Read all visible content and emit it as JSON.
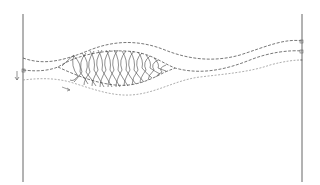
{
  "diagram": {
    "type": "line-drawing",
    "colors": {
      "background": "#ffffff",
      "post": "#666666",
      "dashed_line": "#555555",
      "light_dashed_line": "#999999",
      "mesh": "#444444"
    },
    "elements": {
      "left_post": {
        "x": 23,
        "y_top": 14,
        "y_bottom": 182
      },
      "right_post": {
        "x": 302,
        "y_top": 14,
        "y_bottom": 182
      },
      "arrows": [
        {
          "name": "down-arrow",
          "x": 17,
          "y": 76
        },
        {
          "name": "flow-arrow",
          "x": 67,
          "y": 89
        }
      ]
    }
  }
}
